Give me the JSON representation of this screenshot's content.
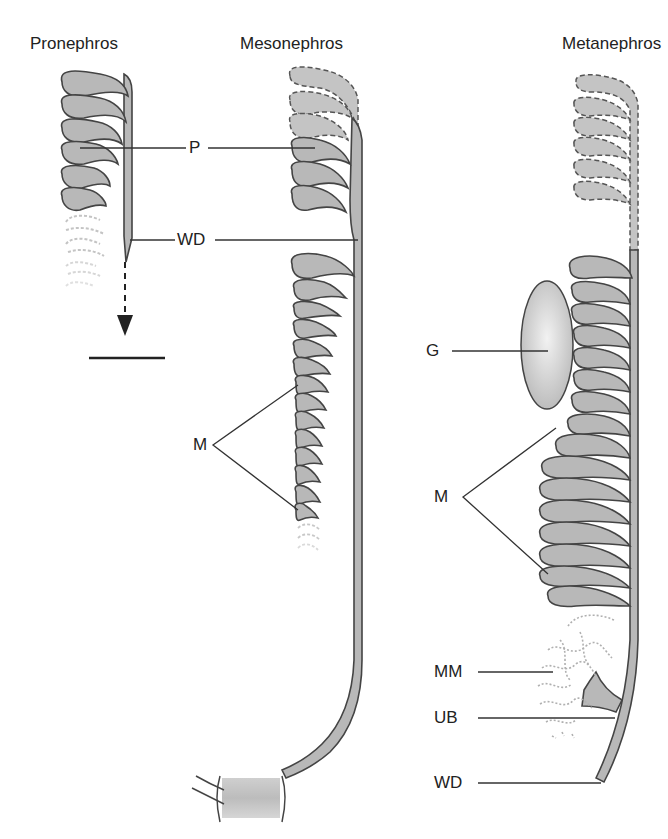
{
  "titles": {
    "pronephros": "Pronephros",
    "mesonephros": "Mesonephros",
    "metanephros": "Metanephros"
  },
  "labels": {
    "p": "P",
    "wd_top": "WD",
    "m_meso": "M",
    "g": "G",
    "m_meta": "M",
    "mm": "MM",
    "ub": "UB",
    "wd_bottom": "WD"
  },
  "colors": {
    "tissue_fill": "#b8b8b8",
    "outline": "#444444",
    "faded": "#c8c8c8",
    "glomerulus_fill": "#d6d6d6"
  }
}
